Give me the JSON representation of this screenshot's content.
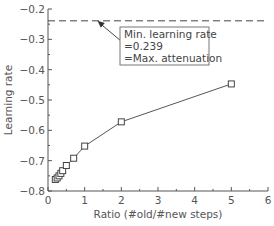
{
  "chart_data": {
    "type": "line",
    "title": "",
    "xlabel": "Ratio (#old/#new steps)",
    "ylabel": "Learning rate",
    "xlim": [
      0,
      6
    ],
    "ylim": [
      -0.8,
      -0.2
    ],
    "xticks": [
      0,
      1,
      2,
      3,
      4,
      5,
      6
    ],
    "xtick_labels": [
      "0",
      "1",
      "2",
      "3",
      "4",
      "5",
      "6"
    ],
    "yticks": [
      -0.8,
      -0.7,
      -0.6,
      -0.5,
      -0.4,
      -0.3,
      -0.2
    ],
    "ytick_labels": [
      "−0.8",
      "−0.7",
      "−0.6",
      "−0.5",
      "−0.4",
      "−0.3",
      "−0.2"
    ],
    "grid": false,
    "legend": null,
    "series": [
      {
        "name": "learning rate vs ratio",
        "marker": "square",
        "line": "solid",
        "x": [
          0.2,
          0.25,
          0.3,
          0.35,
          0.4,
          0.5,
          0.7,
          1.0,
          2.0,
          5.0
        ],
        "y": [
          -0.762,
          -0.757,
          -0.75,
          -0.742,
          -0.733,
          -0.716,
          -0.692,
          -0.652,
          -0.572,
          -0.447
        ]
      }
    ],
    "reference_line": {
      "y": -0.239,
      "style": "dashed"
    },
    "annotation": {
      "lines": [
        "Min. learning rate",
        "=0.239",
        "=Max. attenuation"
      ],
      "arrow_target": {
        "x": 1.35,
        "y": -0.239
      }
    }
  }
}
